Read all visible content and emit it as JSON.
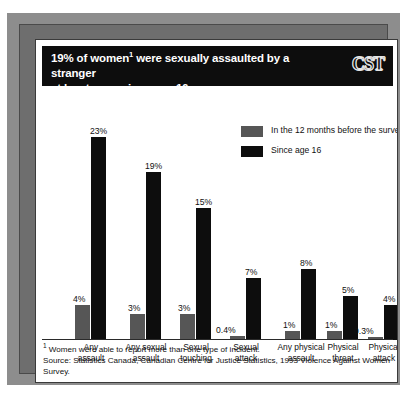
{
  "title": {
    "line1_pre": "19% of women",
    "line1_sup": "1",
    "line1_post": " were sexually assaulted by a stranger",
    "line2": "at least once since age 16",
    "logo": "CST"
  },
  "legend": {
    "items": [
      {
        "label": "In the 12 months before the survey",
        "color": "#565656",
        "key": "recent"
      },
      {
        "label": "Since age 16",
        "color": "#0d0d0d",
        "key": "since"
      }
    ]
  },
  "notes": {
    "footnote_marker": "1",
    "footnote": " Women were able to report more than one type of incident.",
    "source": "Source: Statistics Canada, Canadian Centre for Justice Statistics, 1993 Violence Against Women Survey."
  },
  "chart_data": {
    "type": "bar",
    "xlabel": "",
    "ylabel": "",
    "ylim": [
      0,
      25
    ],
    "grid": false,
    "legend_position": "top-right",
    "categories": [
      "Any assault",
      "Any sexual assault",
      "Sexual touching",
      "Sexual attack",
      "Any physical assault",
      "Physical threat",
      "Physical attack"
    ],
    "category_lines": [
      [
        "Any",
        "assault"
      ],
      [
        "Any sexual",
        "assault"
      ],
      [
        "Sexual",
        "touching"
      ],
      [
        "Sexual",
        "attack"
      ],
      [
        "Any physical",
        "assault"
      ],
      [
        "Physical",
        "threat"
      ],
      [
        "Physical",
        "attack"
      ]
    ],
    "series": [
      {
        "name": "In the 12 months before the survey",
        "color": "#565656",
        "values": [
          4,
          3,
          3,
          0.4,
          1,
          1,
          0.3
        ],
        "labels": [
          "4%",
          "3%",
          "3%",
          "0.4%",
          "1%",
          "1%",
          "0.3%"
        ]
      },
      {
        "name": "Since age 16",
        "color": "#0d0d0d",
        "values": [
          23,
          19,
          15,
          7,
          8,
          5,
          4
        ],
        "labels": [
          "23%",
          "19%",
          "15%",
          "7%",
          "8%",
          "5%",
          "4%"
        ]
      }
    ]
  }
}
